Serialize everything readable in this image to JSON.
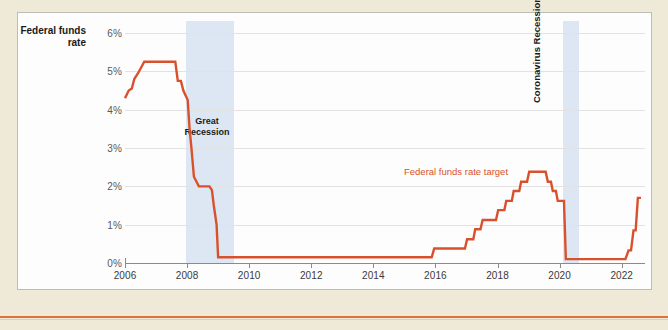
{
  "chart_data": {
    "type": "line",
    "title": "",
    "xlabel": "",
    "ylabel": "Federal funds rate",
    "ylim": [
      0,
      6
    ],
    "xlim": [
      2006,
      2022.75
    ],
    "grid": true,
    "legend_position": "inline-annotation",
    "y_ticks": [
      "0%",
      "1%",
      "2%",
      "3%",
      "4%",
      "5%",
      "6%"
    ],
    "y_tick_values": [
      0,
      1,
      2,
      3,
      4,
      5,
      6
    ],
    "x_ticks": [
      "2006",
      "2008",
      "2010",
      "2012",
      "2014",
      "2016",
      "2018",
      "2020",
      "2022"
    ],
    "x_tick_values": [
      2006,
      2008,
      2010,
      2012,
      2014,
      2016,
      2018,
      2020,
      2022
    ],
    "series": [
      {
        "name": "Federal funds rate target",
        "color": "#D9512C",
        "points": [
          [
            2006.0,
            4.3
          ],
          [
            2006.12,
            4.5
          ],
          [
            2006.22,
            4.55
          ],
          [
            2006.3,
            4.8
          ],
          [
            2006.42,
            4.95
          ],
          [
            2006.52,
            5.1
          ],
          [
            2006.62,
            5.25
          ],
          [
            2007.55,
            5.25
          ],
          [
            2007.62,
            5.25
          ],
          [
            2007.7,
            4.75
          ],
          [
            2007.8,
            4.75
          ],
          [
            2007.88,
            4.5
          ],
          [
            2008.02,
            4.25
          ],
          [
            2008.08,
            3.5
          ],
          [
            2008.14,
            3.0
          ],
          [
            2008.22,
            2.25
          ],
          [
            2008.38,
            2.0
          ],
          [
            2008.72,
            2.0
          ],
          [
            2008.8,
            1.9
          ],
          [
            2008.86,
            1.5
          ],
          [
            2008.95,
            1.0
          ],
          [
            2009.0,
            0.15
          ],
          [
            2015.88,
            0.15
          ],
          [
            2015.96,
            0.38
          ],
          [
            2016.95,
            0.38
          ],
          [
            2017.02,
            0.62
          ],
          [
            2017.22,
            0.62
          ],
          [
            2017.28,
            0.88
          ],
          [
            2017.45,
            0.88
          ],
          [
            2017.52,
            1.12
          ],
          [
            2017.95,
            1.12
          ],
          [
            2018.02,
            1.38
          ],
          [
            2018.22,
            1.38
          ],
          [
            2018.28,
            1.62
          ],
          [
            2018.46,
            1.62
          ],
          [
            2018.52,
            1.88
          ],
          [
            2018.7,
            1.88
          ],
          [
            2018.76,
            2.12
          ],
          [
            2018.95,
            2.12
          ],
          [
            2019.02,
            2.38
          ],
          [
            2019.55,
            2.38
          ],
          [
            2019.62,
            2.12
          ],
          [
            2019.72,
            2.12
          ],
          [
            2019.78,
            1.88
          ],
          [
            2019.88,
            1.88
          ],
          [
            2019.94,
            1.62
          ],
          [
            2020.14,
            1.62
          ],
          [
            2020.2,
            0.1
          ],
          [
            2022.12,
            0.1
          ],
          [
            2022.22,
            0.33
          ],
          [
            2022.3,
            0.33
          ],
          [
            2022.38,
            0.85
          ],
          [
            2022.45,
            0.85
          ],
          [
            2022.52,
            1.7
          ],
          [
            2022.62,
            1.7
          ]
        ]
      }
    ],
    "annotations": [
      {
        "text": "Great Recession",
        "kind": "recession-band-label",
        "x_start": 2007.95,
        "x_end": 2009.5
      },
      {
        "text": "Coronavirus Recession",
        "kind": "recession-band-label",
        "x_start": 2020.12,
        "x_end": 2020.62
      },
      {
        "text": "Federal funds rate target",
        "kind": "series-label",
        "color": "#D9512C"
      }
    ],
    "recession_bands": [
      {
        "label": "Great Recession",
        "x_start": 2007.95,
        "x_end": 2009.5,
        "color": "#CFDEEF"
      },
      {
        "label": "Coronavirus Recession",
        "x_start": 2020.12,
        "x_end": 2020.62,
        "color": "#CFDEEF"
      }
    ]
  },
  "axis_title": {
    "line1": "Federal funds",
    "line2": "rate"
  },
  "annotations": {
    "great_recession_line1": "Great",
    "great_recession_line2": "Recession",
    "coronavirus_recession": "Coronavirus Recession",
    "series_label": "Federal funds rate target"
  },
  "colors": {
    "series": "#D9512C",
    "recession_band": "#CFDEEF",
    "page_background": "#EFE9D8",
    "panel_background": "#FDFDFD",
    "gridline": "#E2E2E2",
    "axis": "#8A8A8A",
    "rule": "#E0713A"
  }
}
